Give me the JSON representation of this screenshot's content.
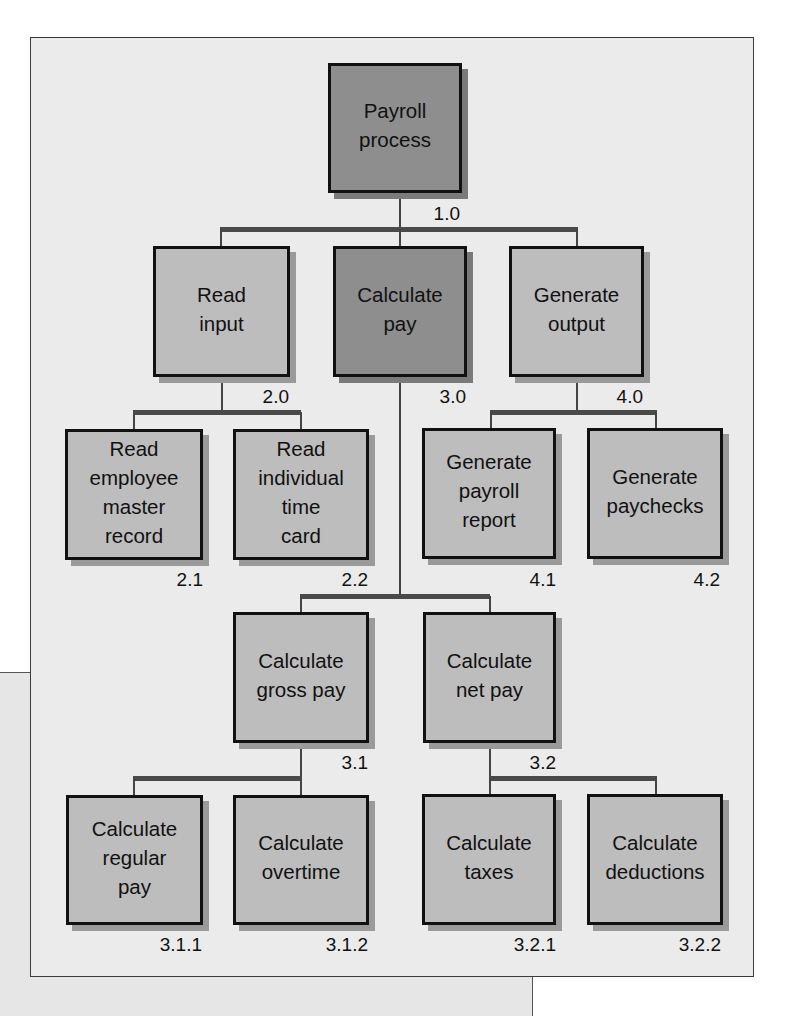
{
  "diagram": {
    "type": "hierarchy-chart",
    "colors": {
      "frame_bg": "#ebebeb",
      "box_light": "#bdbdbd",
      "box_dark": "#8e8e8e",
      "border": "#111111",
      "connector": "#4a4a4a"
    },
    "nodes": [
      {
        "id": "1.0",
        "label": "Payroll\nprocess",
        "style": "dark",
        "parent": null
      },
      {
        "id": "2.0",
        "label": "Read\ninput",
        "style": "light",
        "parent": "1.0"
      },
      {
        "id": "3.0",
        "label": "Calculate\npay",
        "style": "dark",
        "parent": "1.0"
      },
      {
        "id": "4.0",
        "label": "Generate\noutput",
        "style": "light",
        "parent": "1.0"
      },
      {
        "id": "2.1",
        "label": "Read\nemployee\nmaster\nrecord",
        "style": "light",
        "parent": "2.0"
      },
      {
        "id": "2.2",
        "label": "Read\nindividual\ntime\ncard",
        "style": "light",
        "parent": "2.0"
      },
      {
        "id": "4.1",
        "label": "Generate\npayroll\nreport",
        "style": "light",
        "parent": "4.0"
      },
      {
        "id": "4.2",
        "label": "Generate\npaychecks",
        "style": "light",
        "parent": "4.0"
      },
      {
        "id": "3.1",
        "label": "Calculate\ngross pay",
        "style": "light",
        "parent": "3.0"
      },
      {
        "id": "3.2",
        "label": "Calculate\nnet pay",
        "style": "light",
        "parent": "3.0"
      },
      {
        "id": "3.1.1",
        "label": "Calculate\nregular\npay",
        "style": "light",
        "parent": "3.1"
      },
      {
        "id": "3.1.2",
        "label": "Calculate\novertime",
        "style": "light",
        "parent": "3.1"
      },
      {
        "id": "3.2.1",
        "label": "Calculate\ntaxes",
        "style": "light",
        "parent": "3.2"
      },
      {
        "id": "3.2.2",
        "label": "Calculate\ndeductions",
        "style": "light",
        "parent": "3.2"
      }
    ]
  }
}
